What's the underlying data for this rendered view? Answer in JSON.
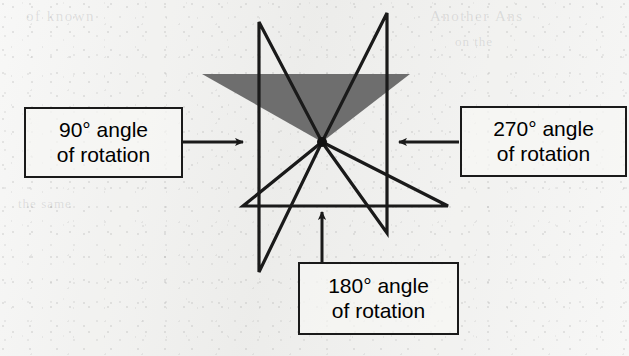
{
  "figure": {
    "background_color": "#f1f1ef",
    "ink_color": "#1a1a1a",
    "shaded_fill_color": "#6e6e6e",
    "center_point": {
      "x": 322,
      "y": 142
    },
    "callouts": [
      {
        "id": "rotation-90",
        "line1": "90° angle",
        "line2": "of rotation",
        "arrow_direction": "right"
      },
      {
        "id": "rotation-270",
        "line1": "270° angle",
        "line2": "of rotation",
        "arrow_direction": "left"
      },
      {
        "id": "rotation-180",
        "line1": "180° angle",
        "line2": "of rotation",
        "arrow_direction": "up"
      }
    ],
    "ghost_text": {
      "top_left": "of known",
      "top_right": "Another Ans",
      "mid_right": "on the",
      "bottom": "the same"
    }
  },
  "chart_data": {
    "type": "diagram",
    "center_of_rotation": [
      322,
      142
    ],
    "shapes": [
      {
        "name": "original-shaded-triangle",
        "fill": "#6e6e6e",
        "stroke": "none",
        "points": [
          [
            202,
            74
          ],
          [
            410,
            74
          ],
          [
            322,
            142
          ]
        ]
      },
      {
        "name": "triangle-rotated-90",
        "fill": "none",
        "stroke": "#1a1a1a",
        "points": [
          [
            259,
            22
          ],
          [
            259,
            272
          ],
          [
            322,
            142
          ]
        ]
      },
      {
        "name": "triangle-rotated-180",
        "fill": "none",
        "stroke": "#1a1a1a",
        "points": [
          [
            243,
            206
          ],
          [
            448,
            206
          ],
          [
            322,
            142
          ]
        ]
      },
      {
        "name": "triangle-rotated-270",
        "fill": "none",
        "stroke": "#1a1a1a",
        "points": [
          [
            387,
            13
          ],
          [
            387,
            233
          ],
          [
            322,
            142
          ]
        ]
      }
    ],
    "annotations": [
      {
        "label": "90° angle of rotation",
        "arrow_from": [
          183,
          142
        ],
        "arrow_to": [
          243,
          142
        ]
      },
      {
        "label": "270° angle of rotation",
        "arrow_from": [
          459,
          142
        ],
        "arrow_to": [
          399,
          142
        ]
      },
      {
        "label": "180° angle of rotation",
        "arrow_from": [
          322,
          262
        ],
        "arrow_to": [
          322,
          212
        ]
      }
    ]
  }
}
